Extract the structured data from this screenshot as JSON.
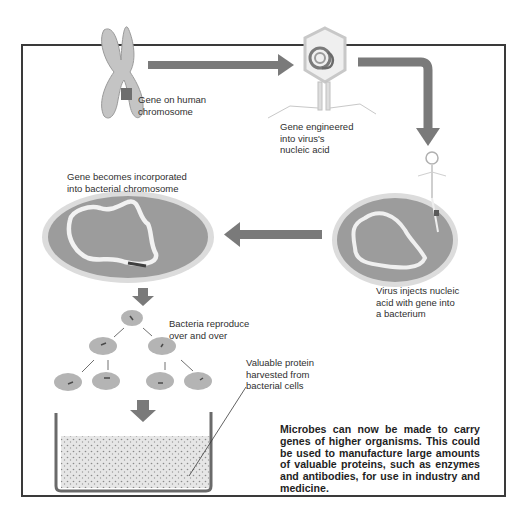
{
  "diagram": {
    "colors": {
      "arrow": "#6f6f6f",
      "bacterium_fill": "#9a9a9a",
      "bacterium_halo": "#d8d8d8",
      "chromosome": "#bdbdbd",
      "frame": "#3a3a3a",
      "dna_loop": "#f2f2f2"
    },
    "steps": [
      {
        "id": "human-chromosome",
        "label_line1": "Gene on human",
        "label_line2": "chromosome"
      },
      {
        "id": "virus",
        "label_line1": "Gene engineered",
        "label_line2": "into virus's",
        "label_line3": "nucleic acid"
      },
      {
        "id": "injection",
        "label_line1": "Virus injects nucleic",
        "label_line2": "acid with gene into",
        "label_line3": "a bacterium"
      },
      {
        "id": "incorporation",
        "label_line1": "Gene becomes incorporated",
        "label_line2": "into bacterial chromosome"
      },
      {
        "id": "reproduction",
        "label_line1": "Bacteria reproduce",
        "label_line2": "over and over"
      },
      {
        "id": "harvest",
        "label_line1": "Valuable protein",
        "label_line2": "harvested from",
        "label_line3": "bacterial cells"
      }
    ],
    "caption": "Microbes can now be made to carry genes of higher organisms. This could be used to manufacture large amounts of valuable proteins, such as enzymes and antibodies, for use in industry and medicine."
  }
}
